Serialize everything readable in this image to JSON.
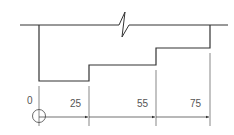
{
  "diagram": {
    "type": "stepped-profile-dimension-drawing",
    "colors": {
      "profile": "#333333",
      "dimension": "#444444",
      "text": "#555555",
      "background": "#ffffff"
    },
    "origin_label": "0",
    "dimensions": [
      {
        "label": "25"
      },
      {
        "label": "55"
      },
      {
        "label": "75"
      }
    ],
    "features": {
      "break_symbol": "z-break on top line",
      "origin_symbol": "circle-with-crosshair"
    }
  }
}
